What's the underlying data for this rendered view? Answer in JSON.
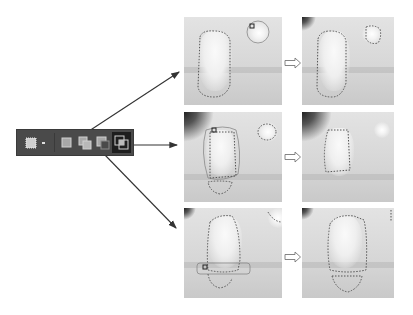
{
  "toolbar": {
    "tool_icon": "marquee-selection-tool-icon",
    "dropdown_icon": "dropdown-dot-icon",
    "modes": [
      {
        "name": "new-selection",
        "icon": "new-selection-icon",
        "active": false
      },
      {
        "name": "add-to-selection",
        "icon": "add-to-selection-icon",
        "active": false
      },
      {
        "name": "subtract-from-selection",
        "icon": "subtract-from-selection-icon",
        "active": false
      },
      {
        "name": "intersect-with-selection",
        "icon": "intersect-with-selection-icon",
        "active": true
      }
    ],
    "colors": {
      "background": "#4a4a4a",
      "active_bg": "#1e1e1e",
      "icon": "#bdbdbd"
    }
  },
  "rows": [
    {
      "label": "add-to-selection",
      "before": "before-image-add",
      "after": "after-image-add"
    },
    {
      "label": "intersect-with-selection",
      "before": "before-image-intersect",
      "after": "after-image-intersect"
    },
    {
      "label": "subtract-from-selection",
      "before": "before-image-subtract",
      "after": "after-image-subtract"
    }
  ],
  "arrow_icon": "hollow-right-arrow-icon"
}
